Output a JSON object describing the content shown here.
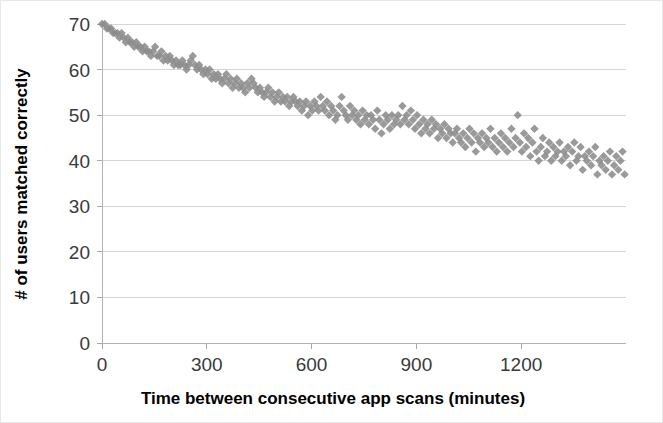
{
  "chart_data": {
    "type": "scatter",
    "title": "",
    "subtitle": "",
    "xlabel": "Time between consecutive app scans (minutes)",
    "ylabel": "# of users matched correctly",
    "xlim": [
      0,
      1500
    ],
    "ylim": [
      0,
      70
    ],
    "xticks": [
      0,
      300,
      600,
      900,
      1200
    ],
    "yticks": [
      0,
      10,
      20,
      30,
      40,
      50,
      60,
      70
    ],
    "xtick_labels": [
      "0",
      "300",
      "600",
      "900",
      "1200"
    ],
    "ytick_labels": [
      "0",
      "10",
      "20",
      "30",
      "40",
      "50",
      "60",
      "70"
    ],
    "grid": "horizontal",
    "legend": "none",
    "marker_shape": "diamond",
    "marker_color": "#8c8c8c",
    "background_color": "#ffffff",
    "gridline_color": "#d6d6d6",
    "series": [
      {
        "name": "users matched",
        "points": [
          [
            0,
            70
          ],
          [
            8,
            70
          ],
          [
            14,
            69
          ],
          [
            20,
            69
          ],
          [
            26,
            69
          ],
          [
            32,
            68
          ],
          [
            38,
            68
          ],
          [
            44,
            68
          ],
          [
            50,
            67
          ],
          [
            56,
            68
          ],
          [
            62,
            67
          ],
          [
            68,
            66
          ],
          [
            74,
            67
          ],
          [
            80,
            66
          ],
          [
            86,
            66
          ],
          [
            92,
            65
          ],
          [
            98,
            66
          ],
          [
            104,
            65
          ],
          [
            110,
            65
          ],
          [
            116,
            64
          ],
          [
            122,
            65
          ],
          [
            128,
            64
          ],
          [
            134,
            64
          ],
          [
            140,
            63
          ],
          [
            146,
            64
          ],
          [
            152,
            65
          ],
          [
            158,
            63
          ],
          [
            164,
            63
          ],
          [
            170,
            64
          ],
          [
            176,
            62
          ],
          [
            182,
            63
          ],
          [
            188,
            62
          ],
          [
            194,
            63
          ],
          [
            200,
            62
          ],
          [
            206,
            61
          ],
          [
            212,
            62
          ],
          [
            218,
            61
          ],
          [
            224,
            61
          ],
          [
            230,
            62
          ],
          [
            236,
            61
          ],
          [
            242,
            60
          ],
          [
            248,
            61
          ],
          [
            254,
            62
          ],
          [
            260,
            63
          ],
          [
            266,
            61
          ],
          [
            272,
            60
          ],
          [
            278,
            61
          ],
          [
            284,
            60
          ],
          [
            290,
            59
          ],
          [
            296,
            60
          ],
          [
            302,
            59
          ],
          [
            308,
            60
          ],
          [
            314,
            58
          ],
          [
            320,
            59
          ],
          [
            326,
            58
          ],
          [
            332,
            59
          ],
          [
            338,
            58
          ],
          [
            344,
            57
          ],
          [
            350,
            58
          ],
          [
            356,
            59
          ],
          [
            362,
            57
          ],
          [
            368,
            58
          ],
          [
            374,
            56
          ],
          [
            380,
            57
          ],
          [
            386,
            58
          ],
          [
            392,
            56
          ],
          [
            398,
            57
          ],
          [
            404,
            56
          ],
          [
            410,
            55
          ],
          [
            416,
            57
          ],
          [
            422,
            56
          ],
          [
            428,
            58
          ],
          [
            434,
            57
          ],
          [
            440,
            56
          ],
          [
            446,
            55
          ],
          [
            452,
            56
          ],
          [
            458,
            55
          ],
          [
            464,
            54
          ],
          [
            470,
            55
          ],
          [
            476,
            56
          ],
          [
            482,
            54
          ],
          [
            488,
            55
          ],
          [
            494,
            53
          ],
          [
            500,
            54
          ],
          [
            506,
            55
          ],
          [
            512,
            53
          ],
          [
            518,
            54
          ],
          [
            524,
            53
          ],
          [
            530,
            54
          ],
          [
            536,
            52
          ],
          [
            542,
            53
          ],
          [
            548,
            54
          ],
          [
            554,
            53
          ],
          [
            560,
            52
          ],
          [
            566,
            53
          ],
          [
            572,
            51
          ],
          [
            578,
            52
          ],
          [
            584,
            53
          ],
          [
            590,
            50
          ],
          [
            596,
            52
          ],
          [
            602,
            51
          ],
          [
            608,
            53
          ],
          [
            614,
            52
          ],
          [
            620,
            51
          ],
          [
            626,
            54
          ],
          [
            632,
            52
          ],
          [
            638,
            51
          ],
          [
            644,
            53
          ],
          [
            650,
            50
          ],
          [
            656,
            52
          ],
          [
            662,
            51
          ],
          [
            668,
            49
          ],
          [
            674,
            50
          ],
          [
            680,
            52
          ],
          [
            686,
            54
          ],
          [
            692,
            51
          ],
          [
            698,
            50
          ],
          [
            704,
            49
          ],
          [
            710,
            52
          ],
          [
            716,
            50
          ],
          [
            722,
            51
          ],
          [
            728,
            49
          ],
          [
            734,
            50
          ],
          [
            740,
            48
          ],
          [
            746,
            51
          ],
          [
            752,
            49
          ],
          [
            758,
            50
          ],
          [
            764,
            48
          ],
          [
            770,
            50
          ],
          [
            776,
            49
          ],
          [
            782,
            47
          ],
          [
            788,
            51
          ],
          [
            794,
            49
          ],
          [
            800,
            46
          ],
          [
            806,
            48
          ],
          [
            812,
            50
          ],
          [
            818,
            49
          ],
          [
            824,
            47
          ],
          [
            830,
            50
          ],
          [
            836,
            48
          ],
          [
            842,
            49
          ],
          [
            848,
            50
          ],
          [
            854,
            48
          ],
          [
            860,
            52
          ],
          [
            866,
            49
          ],
          [
            872,
            50
          ],
          [
            878,
            48
          ],
          [
            884,
            51
          ],
          [
            890,
            49
          ],
          [
            896,
            47
          ],
          [
            902,
            50
          ],
          [
            908,
            48
          ],
          [
            914,
            46
          ],
          [
            920,
            49
          ],
          [
            926,
            47
          ],
          [
            932,
            48
          ],
          [
            938,
            46
          ],
          [
            944,
            49
          ],
          [
            950,
            47
          ],
          [
            956,
            48
          ],
          [
            962,
            45
          ],
          [
            968,
            47
          ],
          [
            974,
            46
          ],
          [
            980,
            48
          ],
          [
            986,
            45
          ],
          [
            992,
            47
          ],
          [
            998,
            46
          ],
          [
            1004,
            44
          ],
          [
            1010,
            46
          ],
          [
            1016,
            47
          ],
          [
            1022,
            45
          ],
          [
            1028,
            44
          ],
          [
            1034,
            46
          ],
          [
            1040,
            43
          ],
          [
            1046,
            45
          ],
          [
            1052,
            47
          ],
          [
            1058,
            44
          ],
          [
            1064,
            46
          ],
          [
            1070,
            42
          ],
          [
            1076,
            45
          ],
          [
            1082,
            44
          ],
          [
            1088,
            46
          ],
          [
            1094,
            43
          ],
          [
            1100,
            45
          ],
          [
            1106,
            44
          ],
          [
            1112,
            47
          ],
          [
            1118,
            43
          ],
          [
            1124,
            45
          ],
          [
            1130,
            42
          ],
          [
            1136,
            44
          ],
          [
            1142,
            46
          ],
          [
            1148,
            43
          ],
          [
            1154,
            45
          ],
          [
            1160,
            42
          ],
          [
            1166,
            44
          ],
          [
            1172,
            47
          ],
          [
            1178,
            43
          ],
          [
            1184,
            45
          ],
          [
            1190,
            50
          ],
          [
            1196,
            44
          ],
          [
            1202,
            42
          ],
          [
            1208,
            46
          ],
          [
            1214,
            43
          ],
          [
            1220,
            45
          ],
          [
            1226,
            41
          ],
          [
            1232,
            44
          ],
          [
            1238,
            47
          ],
          [
            1244,
            42
          ],
          [
            1250,
            40
          ],
          [
            1256,
            43
          ],
          [
            1262,
            45
          ],
          [
            1268,
            41
          ],
          [
            1274,
            42
          ],
          [
            1280,
            44
          ],
          [
            1286,
            40
          ],
          [
            1292,
            43
          ],
          [
            1298,
            41
          ],
          [
            1304,
            42
          ],
          [
            1310,
            44
          ],
          [
            1316,
            40
          ],
          [
            1322,
            42
          ],
          [
            1328,
            41
          ],
          [
            1334,
            43
          ],
          [
            1340,
            39
          ],
          [
            1346,
            42
          ],
          [
            1352,
            44
          ],
          [
            1358,
            40
          ],
          [
            1364,
            41
          ],
          [
            1370,
            43
          ],
          [
            1376,
            38
          ],
          [
            1382,
            41
          ],
          [
            1388,
            40
          ],
          [
            1394,
            42
          ],
          [
            1400,
            39
          ],
          [
            1406,
            41
          ],
          [
            1412,
            43
          ],
          [
            1418,
            37
          ],
          [
            1424,
            40
          ],
          [
            1430,
            39
          ],
          [
            1436,
            41
          ],
          [
            1442,
            38
          ],
          [
            1448,
            40
          ],
          [
            1454,
            42
          ],
          [
            1460,
            37
          ],
          [
            1466,
            39
          ],
          [
            1472,
            41
          ],
          [
            1478,
            38
          ],
          [
            1484,
            40
          ],
          [
            1490,
            42
          ],
          [
            1496,
            37
          ]
        ]
      }
    ]
  }
}
